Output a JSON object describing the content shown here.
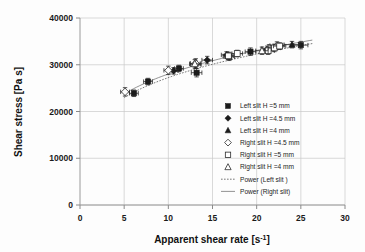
{
  "chart_data": {
    "type": "scatter",
    "title": "",
    "xlabel": "Apparent shear rate [s-1]",
    "xlabel_main": "Apparent shear rate [s",
    "xlabel_sup": "-1",
    "xlabel_tail": "]",
    "ylabel": "Shear stress [Pa s]",
    "xlim": [
      0,
      30
    ],
    "ylim": [
      0,
      40000
    ],
    "xticks": [
      "0",
      "5",
      "10",
      "15",
      "20",
      "25",
      "30"
    ],
    "xtick_values": [
      0,
      5,
      10,
      15,
      20,
      25,
      30
    ],
    "yticks": [
      "0",
      "10000",
      "20000",
      "30000",
      "40000"
    ],
    "ytick_values": [
      0,
      10000,
      20000,
      30000,
      40000
    ],
    "grid": true,
    "grid_axis": "both",
    "legend_position": "inside-lower-right",
    "marker_color": "#1b1b1b",
    "open_marker_fill": "#ffffff",
    "grid_color": "#c9c9c9",
    "series": [
      {
        "name": "Left slit H =5 mm",
        "marker": "filled-square",
        "points": [
          {
            "x": 6.1,
            "y": 23900,
            "yerr": 700,
            "xerr": 0.5
          },
          {
            "x": 7.7,
            "y": 26400,
            "yerr": 700,
            "xerr": 0.5
          },
          {
            "x": 11.2,
            "y": 29200,
            "yerr": 700,
            "xerr": 0.5
          },
          {
            "x": 13.2,
            "y": 28300,
            "yerr": 900,
            "xerr": 0.6
          },
          {
            "x": 16.9,
            "y": 31700,
            "yerr": 800,
            "xerr": 0.6
          },
          {
            "x": 19.3,
            "y": 32800,
            "yerr": 800,
            "xerr": 0.6
          },
          {
            "x": 25.0,
            "y": 34200,
            "yerr": 800,
            "xerr": 0.8
          }
        ]
      },
      {
        "name": "Left slit H =4.5 mm",
        "marker": "filled-diamond",
        "points": [
          {
            "x": 10.6,
            "y": 28700,
            "yerr": 700,
            "xerr": 0.5
          },
          {
            "x": 13.1,
            "y": 30000,
            "yerr": 800,
            "xerr": 0.6
          },
          {
            "x": 14.4,
            "y": 31000,
            "yerr": 800,
            "xerr": 0.6
          },
          {
            "x": 16.6,
            "y": 32100,
            "yerr": 700,
            "xerr": 0.6
          },
          {
            "x": 21.2,
            "y": 33300,
            "yerr": 700,
            "xerr": 0.7
          }
        ]
      },
      {
        "name": "Left slit H =4 mm",
        "marker": "filled-triangle",
        "points": [
          {
            "x": 24.0,
            "y": 34300,
            "yerr": 700,
            "xerr": 0.9
          }
        ]
      },
      {
        "name": "Right slit H =4.5 mm",
        "marker": "open-diamond",
        "points": [
          {
            "x": 5.1,
            "y": 24200,
            "yerr": 900,
            "xerr": 0.5
          },
          {
            "x": 10.0,
            "y": 28800,
            "yerr": 900,
            "xerr": 0.5
          },
          {
            "x": 13.1,
            "y": 30300,
            "yerr": 1000,
            "xerr": 0.6
          },
          {
            "x": 22.3,
            "y": 34100,
            "yerr": 800,
            "xerr": 0.8
          },
          {
            "x": 21.4,
            "y": 33500,
            "yerr": 800,
            "xerr": 0.8
          }
        ]
      },
      {
        "name": "Right slit H =5 mm",
        "marker": "open-square",
        "points": [
          {
            "x": 16.8,
            "y": 31900,
            "yerr": 800,
            "xerr": 0.6
          },
          {
            "x": 17.8,
            "y": 32400,
            "yerr": 700,
            "xerr": 0.6
          },
          {
            "x": 21.3,
            "y": 33000,
            "yerr": 800,
            "xerr": 0.7
          },
          {
            "x": 22.0,
            "y": 33600,
            "yerr": 800,
            "xerr": 0.7
          },
          {
            "x": 22.6,
            "y": 34000,
            "yerr": 700,
            "xerr": 0.7
          }
        ]
      },
      {
        "name": "Right slit H =4 mm",
        "marker": "open-triangle",
        "points": [
          {
            "x": 13.0,
            "y": 30200,
            "yerr": 900,
            "xerr": 0.6
          },
          {
            "x": 20.6,
            "y": 33000,
            "yerr": 800,
            "xerr": 0.7
          }
        ]
      }
    ],
    "trendlines": [
      {
        "name": "Power (Left slit )",
        "style": "dotted",
        "coefficients": {
          "a": 15500,
          "b": 0.245
        },
        "x_from": 5.0,
        "x_to": 26.3
      },
      {
        "name": "Power (Right slit)",
        "style": "solid",
        "coefficients": {
          "a": 16200,
          "b": 0.238
        },
        "x_from": 5.0,
        "x_to": 26.3
      }
    ],
    "legend_entries": [
      {
        "label": "Left slit H =5 mm",
        "marker": "filled-square"
      },
      {
        "label": "Left slit H =4.5 mm",
        "marker": "filled-diamond"
      },
      {
        "label": "Left slit H =4 mm",
        "marker": "filled-triangle"
      },
      {
        "label": "Right slit H =4.5 mm",
        "marker": "open-diamond"
      },
      {
        "label": "Right slit H =5 mm",
        "marker": "open-square"
      },
      {
        "label": "Right slit H =4 mm",
        "marker": "open-triangle"
      },
      {
        "label": "Power (Left slit )",
        "marker": "line-dotted"
      },
      {
        "label": "Power (Right slit)",
        "marker": "line-solid"
      }
    ]
  }
}
